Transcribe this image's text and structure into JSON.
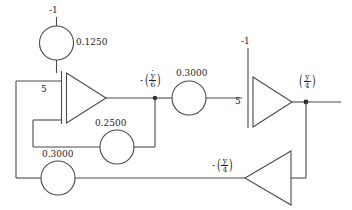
{
  "diagram": {
    "type": "analog-computer-block-diagram",
    "stroke_color": "#4a4a4a",
    "text_color": "#262626",
    "background": "#ffffff",
    "width": 352,
    "height": 210
  },
  "labels": {
    "ic_top_left": "-1",
    "ic_top_right": "-1",
    "pot_top": "0.1250",
    "pot_mid": "0.3000",
    "pot_feedback": "0.2500",
    "pot_bottom": "0.3000",
    "gain_left": "5",
    "gain_right": "5",
    "node_ydot6_minus": "-",
    "node_ydot6_num": "y",
    "node_ydot6_den": "6",
    "node_y4_num": "y",
    "node_y4_den": "4",
    "node_y4_minus": "-",
    "node_y4b_num": "y",
    "node_y4b_den": "4"
  },
  "elements": {
    "integrator_left": {
      "name": "integrator-1",
      "gain": "5",
      "initial_condition": "-1"
    },
    "integrator_right": {
      "name": "integrator-2",
      "gain": "5",
      "initial_condition": "-1"
    },
    "inverter_bottom": {
      "name": "inverter",
      "output": "-(y/4)"
    },
    "potentiometers": [
      {
        "name": "pot-0.1250",
        "value": "0.1250"
      },
      {
        "name": "pot-0.3000-mid",
        "value": "0.3000"
      },
      {
        "name": "pot-0.2500",
        "value": "0.2500"
      },
      {
        "name": "pot-0.3000-bottom",
        "value": "0.3000"
      }
    ],
    "nodes": [
      {
        "name": "node-ydot-over-6",
        "label": "-(y/6)"
      },
      {
        "name": "node-y-over-4",
        "label": "(y/4)"
      }
    ]
  }
}
